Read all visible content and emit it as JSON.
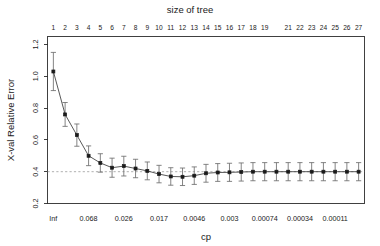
{
  "chart_data": {
    "type": "line",
    "title": "size of tree",
    "xlabel": "cp",
    "ylabel": "X-val Relative Error",
    "grid": false,
    "legend": null,
    "xlim": [
      0.5,
      27.5
    ],
    "ylim": [
      0.2,
      1.25
    ],
    "yticks": [
      "1.2",
      "1.0",
      "0.8",
      "0.6",
      "0.4",
      "0.2"
    ],
    "ytick_values": [
      1.2,
      1.0,
      0.8,
      0.6,
      0.4,
      0.2
    ],
    "top_axis_label": "size of tree",
    "top_tick_labels": [
      "1",
      "2",
      "3",
      "4",
      "5",
      "6",
      "7",
      "8",
      "9",
      "10",
      "11",
      "12",
      "13",
      "14",
      "15",
      "16",
      "17",
      "18",
      "19",
      "21",
      "22",
      "23",
      "24",
      "25",
      "26",
      "27"
    ],
    "top_tick_positions": [
      1,
      2,
      3,
      4,
      5,
      6,
      7,
      8,
      9,
      10,
      11,
      12,
      13,
      14,
      15,
      16,
      17,
      18,
      19,
      21,
      22,
      23,
      24,
      25,
      26,
      27
    ],
    "bottom_tick_labels": [
      "Inf",
      "0.068",
      "0.026",
      "0.017",
      "0.0046",
      "0.003",
      "0.00074",
      "0.00034",
      "0.00011"
    ],
    "bottom_tick_positions": [
      1,
      4,
      7,
      10,
      13,
      16,
      19,
      22,
      25
    ],
    "reference_line": {
      "y": 0.4,
      "style": "dashed",
      "color": "#9a9a9a"
    },
    "x": [
      1,
      2,
      3,
      4,
      5,
      6,
      7,
      8,
      9,
      10,
      11,
      12,
      13,
      14,
      15,
      16,
      17,
      18,
      19,
      20,
      21,
      22,
      23,
      24,
      25,
      26,
      27
    ],
    "values": [
      1.03,
      0.76,
      0.63,
      0.5,
      0.455,
      0.425,
      0.435,
      0.42,
      0.405,
      0.385,
      0.37,
      0.368,
      0.375,
      0.39,
      0.395,
      0.396,
      0.398,
      0.4,
      0.4,
      0.4,
      0.4,
      0.4,
      0.4,
      0.4,
      0.4,
      0.4,
      0.4
    ],
    "errors": [
      0.12,
      0.075,
      0.07,
      0.062,
      0.058,
      0.06,
      0.062,
      0.058,
      0.056,
      0.055,
      0.055,
      0.055,
      0.055,
      0.056,
      0.056,
      0.057,
      0.057,
      0.057,
      0.057,
      0.057,
      0.057,
      0.057,
      0.057,
      0.057,
      0.057,
      0.057,
      0.057
    ],
    "series": [
      {
        "name": "xerror",
        "values": [
          1.03,
          0.76,
          0.63,
          0.5,
          0.455,
          0.425,
          0.435,
          0.42,
          0.405,
          0.385,
          0.37,
          0.368,
          0.375,
          0.39,
          0.395,
          0.396,
          0.398,
          0.4,
          0.4,
          0.4,
          0.4,
          0.4,
          0.4,
          0.4,
          0.4,
          0.4,
          0.4
        ]
      }
    ],
    "colors": {
      "line": "#3a3a3a",
      "point": "#1a1a1a",
      "errorbar": "#6e6e6e",
      "axis": "#2b2b2b",
      "reference": "#9a9a9a",
      "background": "#ffffff"
    }
  }
}
